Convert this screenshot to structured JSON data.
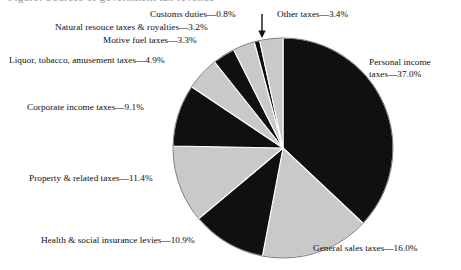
{
  "figure": {
    "title_clipped": "Figure: Sources of government tax revenue",
    "background_color": "#ffffff",
    "text_color": "#0d0d0d"
  },
  "pointer": {
    "name": "customs-duties-leader-arrow",
    "glyph": "arrow-down-icon"
  },
  "chart_data": {
    "type": "pie",
    "title": "",
    "xlabel": "",
    "ylabel": "",
    "legend_position": "none",
    "grid": false,
    "start_angle_deg": 90,
    "direction": "clockwise",
    "value_unit": "percent",
    "total": 100.0,
    "categories": [
      "Personal income taxes",
      "General sales taxes",
      "Health & social insurance levies",
      "Property & related taxes",
      "Corporate income taxes",
      "Liquor, tobacco, amusement taxes",
      "Motive fuel taxes",
      "Natural resouce taxes & royalties",
      "Customs duties",
      "Other taxes"
    ],
    "values": [
      37.0,
      16.0,
      10.9,
      11.4,
      9.1,
      4.9,
      3.3,
      3.2,
      0.8,
      3.4
    ],
    "colors": [
      "#101010",
      "#c9c9c9",
      "#101010",
      "#c9c9c9",
      "#101010",
      "#c9c9c9",
      "#101010",
      "#c9c9c9",
      "#101010",
      "#c9c9c9"
    ],
    "slice_labels": [
      "Personal income taxes—37.0%",
      "General sales taxes—16.0%",
      "Health & social insurance levies—10.9%",
      "Property & related taxes—11.4%",
      "Corporate income taxes—9.1%",
      "Liquor, tobacco, amusement taxes—4.9%",
      "Motive fuel taxes—3.3%",
      "Natural resouce taxes & royalties—3.2%",
      "Customs duties—0.8%",
      "Other taxes—3.4%"
    ]
  },
  "labels": {
    "customs_duties": "Customs duties—0.8%",
    "other_taxes": "Other taxes—3.4%",
    "natural_resource": "Natural resouce taxes & royalties—3.2%",
    "motive_fuel": "Motive fuel taxes—3.3%",
    "liquor_tobacco": "Liquor, tobacco, amusement taxes—4.9%",
    "corporate_income": "Corporate income taxes—9.1%",
    "property_related": "Property & related taxes—11.4%",
    "health_social": "Health & social insurance levies—10.9%",
    "general_sales": "General sales taxes—16.0%",
    "personal_income_line1": "Personal income",
    "personal_income_line2": "taxes—37.0%"
  }
}
